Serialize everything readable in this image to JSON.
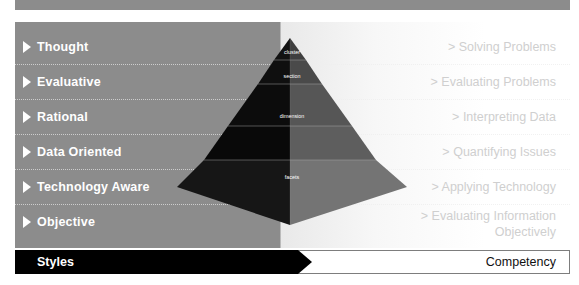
{
  "rows": [
    {
      "style": "Thought",
      "competency": "Solving Problems"
    },
    {
      "style": "Evaluative",
      "competency": "Evaluating Problems"
    },
    {
      "style": "Rational",
      "competency": "Interpreting Data"
    },
    {
      "style": "Data Oriented",
      "competency": "Quantifying Issues"
    },
    {
      "style": "Technology Aware",
      "competency": "Applying Technology"
    },
    {
      "style": "Objective",
      "competency_line1": "Evaluating Information",
      "competency_line2": "Objectively"
    }
  ],
  "competency_prefix": ">",
  "pyramid": {
    "labels": [
      "cluster",
      "section",
      "dimension",
      "facets"
    ]
  },
  "footer": {
    "left_label": "Styles",
    "right_label": "Competency"
  },
  "colors": {
    "panel_left": "#8c8c8c",
    "panel_right": "#ffffff",
    "footer_left_bg": "#000000",
    "footer_right_bg": "#ffffff",
    "style_text": "#ffffff",
    "competency_text": "#cfcfcf",
    "pyramid_dark": "#0d0d0d",
    "pyramid_light": "#6f6f6f"
  }
}
